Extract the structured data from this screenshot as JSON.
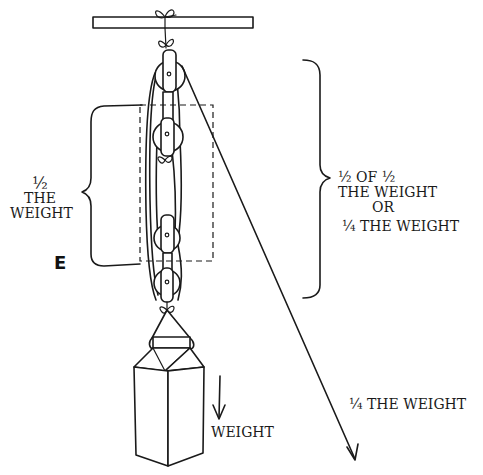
{
  "diagram": {
    "type": "block-and-tackle pulley system illustration",
    "top_cutoff_text": "",
    "labels": {
      "left_half": {
        "line1": "½",
        "line2": "THE",
        "line3": "WEIGHT"
      },
      "effort_marker": "E",
      "right_quarter": {
        "line1": "½ OF ½",
        "line2": "THE WEIGHT",
        "line3": "OR",
        "line4": "¼ THE WEIGHT"
      },
      "pull_force": "¼ THE WEIGHT",
      "load": "WEIGHT"
    },
    "elements": {
      "ceiling_beam": "beam",
      "pulleys_count": 4,
      "load_object": "carton-shaped weight",
      "dashed_box": "movable pulley block region",
      "pull_rope_arrow": "downward-right rope arrow",
      "weight_arrow": "downward arrow"
    },
    "colors": {
      "ink": "#1a1a1a",
      "background": "#ffffff"
    }
  }
}
